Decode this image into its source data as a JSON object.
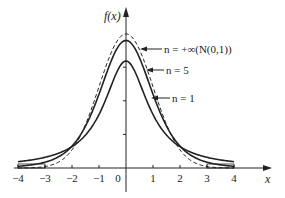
{
  "chart_data": {
    "type": "line",
    "title": "",
    "xlabel": "x",
    "ylabel": "f(x)",
    "xlim": [
      -4,
      4
    ],
    "ylim": [
      0,
      0.42
    ],
    "grid": false,
    "x_ticks": [
      "-4",
      "-3",
      "-2",
      "-1",
      "0",
      "1",
      "2",
      "3",
      "4"
    ],
    "y_ticks_unlabeled": [
      0.1,
      0.2,
      0.3
    ],
    "x": [
      -4,
      -3,
      -2,
      -1,
      0,
      1,
      2,
      3,
      4
    ],
    "series": [
      {
        "name": "n = +∞ (N(0,1))",
        "style": "dashed",
        "values": [
          0.0001,
          0.0044,
          0.054,
          0.242,
          0.399,
          0.242,
          0.054,
          0.0044,
          0.0001
        ]
      },
      {
        "name": "n = 5",
        "style": "solid",
        "values": [
          0.005,
          0.017,
          0.065,
          0.22,
          0.38,
          0.22,
          0.065,
          0.017,
          0.005
        ]
      },
      {
        "name": "n = 1",
        "style": "solid",
        "values": [
          0.019,
          0.032,
          0.064,
          0.159,
          0.318,
          0.159,
          0.064,
          0.032,
          0.019
        ]
      }
    ],
    "annotations": [
      {
        "text": "n = +∞(N(0,1))",
        "arrow_to": "x≈0.5, upper curve"
      },
      {
        "text": "n = 5",
        "arrow_to": "x≈0.75"
      },
      {
        "text": "n = 1",
        "arrow_to": "x≈0.95"
      }
    ]
  },
  "labels": {
    "ylabel": "f(x)",
    "xlabel": "x",
    "ticks": [
      "-4",
      "-3",
      "-2",
      "-1",
      "0",
      "1",
      "2",
      "3",
      "4"
    ],
    "ann_inf": "n = +∞(N(0,1))",
    "ann_5": "n = 5",
    "ann_1": "n = 1"
  }
}
